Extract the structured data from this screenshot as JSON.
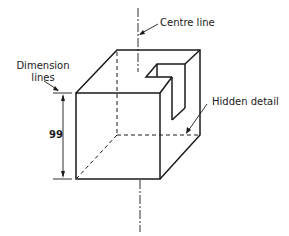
{
  "diagram": {
    "type": "isometric-technical-drawing",
    "labels": {
      "centre_line": "Centre line",
      "dimension_lines_line1": "Dimension",
      "dimension_lines_line2": "lines",
      "hidden_detail": "Hidden detail",
      "dimension_value": "99"
    },
    "colors": {
      "line": "#1a1a1a",
      "background": "#ffffff"
    }
  }
}
